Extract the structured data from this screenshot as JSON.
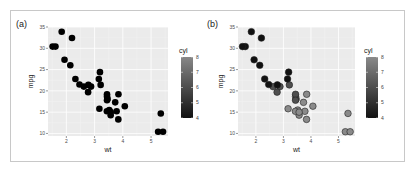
{
  "figure": {
    "background": "#ffffff",
    "frame_color": "#c8c8c8",
    "panel_bg": "#ebebeb",
    "grid_major": "#ffffff",
    "grid_minor": "#f3f3f3"
  },
  "panels": [
    {
      "label": "(a)",
      "xlabel": "wt",
      "ylabel": "mpg",
      "legend_title": "cyl",
      "style": "solid"
    },
    {
      "label": "(b)",
      "xlabel": "wt",
      "ylabel": "mpg",
      "legend_title": "cyl",
      "style": "shaded"
    }
  ],
  "chart_data": [
    {
      "type": "scatter",
      "title": "(a)",
      "xlabel": "wt",
      "ylabel": "mpg",
      "xlim": [
        1.35,
        5.6
      ],
      "ylim": [
        9.4,
        35.0
      ],
      "xticks": [
        2,
        3,
        4,
        5
      ],
      "yticks": [
        10,
        15,
        20,
        25,
        30,
        35
      ],
      "grid": true,
      "legend": {
        "title": "cyl",
        "type": "colorbar",
        "ticks": [
          4,
          5,
          6,
          7,
          8
        ],
        "position": "right",
        "low_color": "#132b43",
        "high_color": "#56b1f7"
      },
      "point_style": "all points drawn black (color mapping not visible)",
      "points": [
        {
          "wt": 2.62,
          "mpg": 21.0,
          "cyl": 6
        },
        {
          "wt": 2.875,
          "mpg": 21.0,
          "cyl": 6
        },
        {
          "wt": 2.32,
          "mpg": 22.8,
          "cyl": 4
        },
        {
          "wt": 3.215,
          "mpg": 21.4,
          "cyl": 6
        },
        {
          "wt": 3.44,
          "mpg": 18.7,
          "cyl": 8
        },
        {
          "wt": 3.46,
          "mpg": 18.1,
          "cyl": 6
        },
        {
          "wt": 3.57,
          "mpg": 14.3,
          "cyl": 8
        },
        {
          "wt": 3.19,
          "mpg": 24.4,
          "cyl": 4
        },
        {
          "wt": 3.15,
          "mpg": 22.8,
          "cyl": 4
        },
        {
          "wt": 3.44,
          "mpg": 19.2,
          "cyl": 6
        },
        {
          "wt": 3.44,
          "mpg": 17.8,
          "cyl": 6
        },
        {
          "wt": 4.07,
          "mpg": 16.4,
          "cyl": 8
        },
        {
          "wt": 3.73,
          "mpg": 17.3,
          "cyl": 8
        },
        {
          "wt": 3.78,
          "mpg": 15.2,
          "cyl": 8
        },
        {
          "wt": 5.25,
          "mpg": 10.4,
          "cyl": 8
        },
        {
          "wt": 5.424,
          "mpg": 10.4,
          "cyl": 8
        },
        {
          "wt": 5.345,
          "mpg": 14.7,
          "cyl": 8
        },
        {
          "wt": 2.2,
          "mpg": 32.4,
          "cyl": 4
        },
        {
          "wt": 1.615,
          "mpg": 30.4,
          "cyl": 4
        },
        {
          "wt": 1.835,
          "mpg": 33.9,
          "cyl": 4
        },
        {
          "wt": 2.465,
          "mpg": 21.5,
          "cyl": 4
        },
        {
          "wt": 3.52,
          "mpg": 15.5,
          "cyl": 8
        },
        {
          "wt": 3.435,
          "mpg": 15.2,
          "cyl": 8
        },
        {
          "wt": 3.84,
          "mpg": 13.3,
          "cyl": 8
        },
        {
          "wt": 3.845,
          "mpg": 19.2,
          "cyl": 8
        },
        {
          "wt": 1.935,
          "mpg": 27.3,
          "cyl": 4
        },
        {
          "wt": 2.14,
          "mpg": 26.0,
          "cyl": 4
        },
        {
          "wt": 1.513,
          "mpg": 30.4,
          "cyl": 4
        },
        {
          "wt": 3.17,
          "mpg": 15.8,
          "cyl": 8
        },
        {
          "wt": 2.77,
          "mpg": 19.7,
          "cyl": 6
        },
        {
          "wt": 3.57,
          "mpg": 15.0,
          "cyl": 8
        },
        {
          "wt": 2.78,
          "mpg": 21.4,
          "cyl": 4
        }
      ]
    },
    {
      "type": "scatter",
      "title": "(b)",
      "xlabel": "wt",
      "ylabel": "mpg",
      "xlim": [
        1.35,
        5.6
      ],
      "ylim": [
        9.4,
        35.0
      ],
      "xticks": [
        2,
        3,
        4,
        5
      ],
      "yticks": [
        10,
        15,
        20,
        25,
        30,
        35
      ],
      "grid": true,
      "legend": {
        "title": "cyl",
        "type": "colorbar",
        "ticks": [
          4,
          5,
          6,
          7,
          8
        ],
        "position": "right",
        "low_color": "#111111",
        "high_color": "#8a8a8a"
      },
      "point_style": "fill mapped by cyl on grey gradient with dark outline",
      "points": "same as panel (a)"
    }
  ]
}
